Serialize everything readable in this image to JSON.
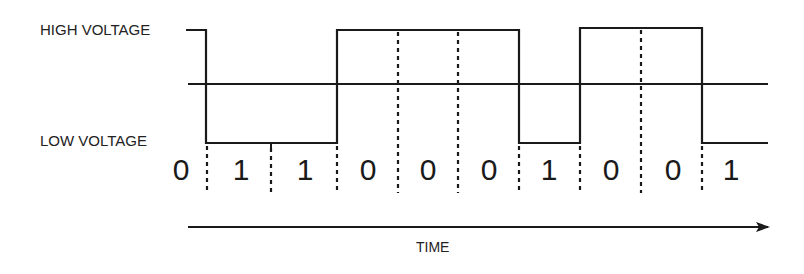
{
  "labels": {
    "high_voltage": "HIGH VOLTAGE",
    "low_voltage": "LOW VOLTAGE",
    "time": "TIME"
  },
  "bits": [
    "0",
    "1",
    "1",
    "0",
    "0",
    "0",
    "1",
    "0",
    "0",
    "1"
  ],
  "geometry": {
    "high_y": 30,
    "low_y": 143,
    "mid_y": 84,
    "boundaries_x": [
      207,
      271,
      337,
      398,
      458,
      519,
      580,
      641,
      702
    ],
    "bit_centers_x": [
      181,
      241,
      305,
      368,
      428,
      489,
      549,
      611,
      673,
      731
    ]
  },
  "colors": {
    "stroke": "#1a1a1a",
    "text": "#222222",
    "background": "#ffffff"
  }
}
